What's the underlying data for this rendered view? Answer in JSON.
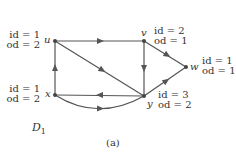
{
  "figure": {
    "graph_name": "D",
    "graph_subscript": "1",
    "caption": "(a)",
    "edge_color": "#555555",
    "node_color": "#444444"
  },
  "nodes": [
    {
      "id": "u",
      "x": 55,
      "y": 41,
      "label_id": "id = 1",
      "label_od": "od = 2"
    },
    {
      "id": "v",
      "x": 144,
      "y": 41,
      "label_id": "id = 2",
      "label_od": "od = 1"
    },
    {
      "id": "w",
      "x": 186,
      "y": 67,
      "label_id": "id = 1",
      "label_od": "od = 1"
    },
    {
      "id": "x",
      "x": 55,
      "y": 95,
      "label_id": "id = 1",
      "label_od": "od = 2"
    },
    {
      "id": "y",
      "x": 144,
      "y": 96,
      "label_id": "id = 3",
      "label_od": "od = 2"
    }
  ],
  "edges": [
    {
      "from": "u",
      "to": "v"
    },
    {
      "from": "u",
      "to": "y"
    },
    {
      "from": "v",
      "to": "y"
    },
    {
      "from": "v",
      "to": "w"
    },
    {
      "from": "y",
      "to": "w"
    },
    {
      "from": "y",
      "to": "x"
    },
    {
      "from": "x",
      "to": "u"
    },
    {
      "from": "x",
      "to": "y",
      "curved": true
    }
  ]
}
